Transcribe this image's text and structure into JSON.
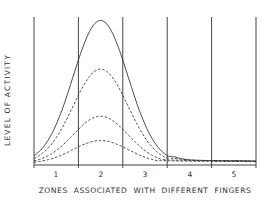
{
  "chart_data": {
    "type": "line",
    "title": "",
    "xlabel": "ZONES ASSOCIATED WITH DIFFERENT FINGERS",
    "ylabel": "LEVEL OF ACTIVITY",
    "categories": [
      "1",
      "2",
      "3",
      "4",
      "5"
    ],
    "zone_boundaries": [
      0.5,
      1.5,
      2.5,
      3.5,
      4.5,
      5.5
    ],
    "grid": {
      "vertical_lines": true,
      "horizontal_lines": false
    },
    "legend": null,
    "ylim": [
      0,
      1
    ],
    "xlim": [
      0.5,
      5.5
    ],
    "series": [
      {
        "name": "curve-1 (solid)",
        "style": "solid",
        "peak_x": 2.0,
        "peak": 1.0,
        "values_at_zone_centers": [
          0.45,
          1.0,
          0.45,
          0.05,
          0.01
        ]
      },
      {
        "name": "curve-2 (dashed)",
        "style": "dashed",
        "peak_x": 2.0,
        "peak": 0.66,
        "values_at_zone_centers": [
          0.3,
          0.66,
          0.3,
          0.04,
          0.01
        ]
      },
      {
        "name": "curve-3 (dashed)",
        "style": "dashed",
        "peak_x": 2.0,
        "peak": 0.33,
        "values_at_zone_centers": [
          0.15,
          0.33,
          0.15,
          0.03,
          0.01
        ]
      },
      {
        "name": "curve-4 (dashed)",
        "style": "dashed",
        "peak_x": 2.0,
        "peak": 0.16,
        "values_at_zone_centers": [
          0.08,
          0.16,
          0.08,
          0.02,
          0.01
        ]
      }
    ]
  },
  "axis": {
    "ylabel": "LEVEL OF ACTIVITY",
    "xlabel": "ZONES ASSOCIATED WITH DIFFERENT FINGERS",
    "ticks": [
      "1",
      "2",
      "3",
      "4",
      "5"
    ]
  }
}
